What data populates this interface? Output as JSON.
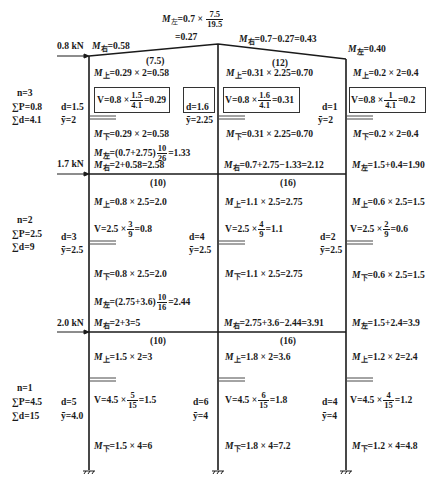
{
  "roof": {
    "top_formula": {
      "prefix": "M",
      "sub": "左",
      "expr": "=0.7 ×",
      "frac_n": "7.5",
      "frac_d": "19.5",
      "result": "=0.27"
    },
    "left_joint": {
      "prefix": "M",
      "sub": "右",
      "expr": "=0.58"
    },
    "mid_joint": {
      "prefix": "M",
      "sub": "右",
      "expr": "=0.7−0.27=0.43"
    },
    "right_joint": {
      "prefix": "M",
      "sub": "左",
      "expr": "=0.40"
    },
    "load": "0.8 kN",
    "beam_left_stiffness": "(7.5)",
    "beam_right_stiffness": "(12)"
  },
  "story3": {
    "summary": {
      "n": "n=3",
      "sumP": "∑P=0.8",
      "sumd": "∑d=4.1"
    },
    "col_left": {
      "d": "d=1.5",
      "y": "ȳ=2",
      "m_top": {
        "prefix": "M",
        "sub": "上",
        "expr": "=0.29 × 2=0.58"
      },
      "v": {
        "prefix": "V=0.8 ×",
        "frac_n": "1.5",
        "frac_d": "4.1",
        "result": "=0.29"
      },
      "m_bot": {
        "prefix": "M",
        "sub": "下",
        "expr": "=0.29 × 2=0.58"
      }
    },
    "col_mid": {
      "d": "d=1.6",
      "y": "ȳ=2.25",
      "m_top": {
        "prefix": "M",
        "sub": "上",
        "expr": "=0.31 × 2.25=0.70"
      },
      "v": {
        "prefix": "V=0.8 ×",
        "frac_n": "1.6",
        "frac_d": "4.1",
        "result": "=0.31"
      },
      "m_bot": {
        "prefix": "M",
        "sub": "下",
        "expr": "=0.31 × 2.25=0.70"
      }
    },
    "col_right": {
      "d": "d=1",
      "y": "ȳ=2",
      "m_top": {
        "prefix": "M",
        "sub": "上",
        "expr": "=0.2 × 2=0.4"
      },
      "v": {
        "prefix": "V=0.8 ×",
        "frac_n": "1",
        "frac_d": "4.1",
        "result": "=0.2"
      },
      "m_bot": {
        "prefix": "M",
        "sub": "下",
        "expr": "=0.2 × 2=0.4"
      }
    },
    "joint_left_Mleft": {
      "prefix": "M",
      "sub": "左",
      "expr": "=(0.7+2.75)",
      "frac_n": "10",
      "frac_d": "26",
      "result": "=1.33"
    }
  },
  "floor2": {
    "load": "1.7 kN",
    "left_joint": {
      "prefix": "M",
      "sub": "右",
      "expr": "=2+0.58=2.58"
    },
    "mid_joint": {
      "prefix": "M",
      "sub": "右",
      "expr": "=0.7+2.75−1.33=2.12"
    },
    "right_joint": {
      "prefix": "M",
      "sub": "左",
      "expr": "=1.5+0.4=1.90"
    },
    "beam_left_stiffness": "(10)",
    "beam_right_stiffness": "(16)"
  },
  "story2": {
    "summary": {
      "n": "n=2",
      "sumP": "∑P=2.5",
      "sumd": "∑d=9"
    },
    "col_left": {
      "d": "d=3",
      "y": "ȳ=2.5",
      "m_top": {
        "prefix": "M",
        "sub": "上",
        "expr": "=0.8 × 2.5=2.0"
      },
      "v": {
        "prefix": "V=2.5 ×",
        "frac_n": "3",
        "frac_d": "9",
        "result": "=0.8"
      },
      "m_bot": {
        "prefix": "M",
        "sub": "下",
        "expr": "=0.8 × 2.5=2.0"
      }
    },
    "col_mid": {
      "d": "d=4",
      "y": "ȳ=2.5",
      "m_top": {
        "prefix": "M",
        "sub": "上",
        "expr": "=1.1 × 2.5=2.75"
      },
      "v": {
        "prefix": "V=2.5 ×",
        "frac_n": "4",
        "frac_d": "9",
        "result": "=1.1"
      },
      "m_bot": {
        "prefix": "M",
        "sub": "下",
        "expr": "=1.1 × 2.5=2.75"
      }
    },
    "col_right": {
      "d": "d=2",
      "y": "ȳ=2.5",
      "m_top": {
        "prefix": "M",
        "sub": "上",
        "expr": "=0.6 × 2.5=1.5"
      },
      "v": {
        "prefix": "V=2.5 ×",
        "frac_n": "2",
        "frac_d": "9",
        "result": "=0.6"
      },
      "m_bot": {
        "prefix": "M",
        "sub": "下",
        "expr": "=0.6 × 2.5=1.5"
      }
    },
    "joint_left_Mleft": {
      "prefix": "M",
      "sub": "左",
      "expr": "=(2.75+3.6)",
      "frac_n": "10",
      "frac_d": "16",
      "result": "=2.44"
    }
  },
  "floor1": {
    "load": "2.0 kN",
    "left_joint": {
      "prefix": "M",
      "sub": "右",
      "expr": "=2+3=5"
    },
    "mid_joint": {
      "prefix": "M",
      "sub": "右",
      "expr": "=2.75+3.6−2.44=3.91"
    },
    "right_joint": {
      "prefix": "M",
      "sub": "左",
      "expr": "=1.5+2.4=3.9"
    },
    "beam_left_stiffness": "(10)",
    "beam_right_stiffness": "(16)"
  },
  "story1": {
    "summary": {
      "n": "n=1",
      "sumP": "∑P=4.5",
      "sumd": "∑d=15"
    },
    "col_left": {
      "d": "d=5",
      "y": "ȳ=4.0",
      "m_top": {
        "prefix": "M",
        "sub": "上",
        "expr": "=1.5 × 2=3"
      },
      "v": {
        "prefix": "V=4.5 ×",
        "frac_n": "5",
        "frac_d": "15",
        "result": "=1.5"
      },
      "m_bot": {
        "prefix": "M",
        "sub": "下",
        "expr": "=1.5 × 4=6"
      }
    },
    "col_mid": {
      "d": "d=6",
      "y": "ȳ=4",
      "m_top": {
        "prefix": "M",
        "sub": "上",
        "expr": "=1.8 × 2=3.6"
      },
      "v": {
        "prefix": "V=4.5 ×",
        "frac_n": "6",
        "frac_d": "15",
        "result": "=1.8"
      },
      "m_bot": {
        "prefix": "M",
        "sub": "下",
        "expr": "=1.8 × 4=7.2"
      }
    },
    "col_right": {
      "d": "d=4",
      "y": "ȳ=4",
      "m_top": {
        "prefix": "M",
        "sub": "上",
        "expr": "=1.2 × 2=2.4"
      },
      "v": {
        "prefix": "V=4.5 ×",
        "frac_n": "4",
        "frac_d": "15",
        "result": "=1.2"
      },
      "m_bot": {
        "prefix": "M",
        "sub": "下",
        "expr": "=1.2 × 4=4.8"
      }
    }
  }
}
